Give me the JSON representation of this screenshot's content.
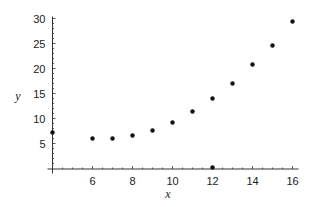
{
  "chart_data": {
    "type": "scatter",
    "title": "",
    "xlabel": "x",
    "ylabel": "y",
    "xlim": [
      4,
      16.3
    ],
    "ylim": [
      0,
      30
    ],
    "x_ticks": [
      6,
      8,
      10,
      12,
      14,
      16
    ],
    "y_ticks": [
      5,
      10,
      15,
      20,
      25,
      30
    ],
    "x_tick_labels": [
      "6",
      "8",
      "10",
      "12",
      "14",
      "16"
    ],
    "y_tick_labels": [
      "5",
      "10",
      "15",
      "20",
      "25",
      "30"
    ],
    "grid": false,
    "legend": null,
    "points": [
      {
        "x": 4,
        "y": 7.2
      },
      {
        "x": 6,
        "y": 6.0
      },
      {
        "x": 7,
        "y": 6.0
      },
      {
        "x": 8,
        "y": 6.6
      },
      {
        "x": 9,
        "y": 7.6
      },
      {
        "x": 10,
        "y": 9.2
      },
      {
        "x": 11,
        "y": 11.4
      },
      {
        "x": 12,
        "y": 14.0
      },
      {
        "x": 13,
        "y": 17.0
      },
      {
        "x": 14,
        "y": 20.8
      },
      {
        "x": 15,
        "y": 24.6
      },
      {
        "x": 16,
        "y": 29.4
      },
      {
        "x": 12,
        "y": 0.2
      }
    ],
    "colors": {
      "points": "#111111",
      "axes": "#333333"
    }
  }
}
